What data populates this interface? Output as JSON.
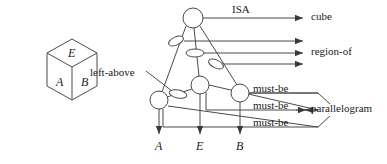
{
  "figure": {
    "type": "semantic-network-diagram",
    "cube": {
      "name": "cube-figure",
      "faces": [
        {
          "id": "top",
          "label": "E"
        },
        {
          "id": "left",
          "label": "A"
        },
        {
          "id": "right",
          "label": "B"
        }
      ]
    },
    "graph": {
      "nodes": [
        {
          "id": "n-top",
          "shape": "circle",
          "cx": 193,
          "cy": 18,
          "r": 10
        },
        {
          "id": "n-mid",
          "shape": "circle",
          "cx": 200,
          "cy": 85,
          "r": 9
        },
        {
          "id": "n-left",
          "shape": "circle",
          "cx": 159,
          "cy": 100,
          "r": 9
        },
        {
          "id": "n-right",
          "shape": "circle",
          "cx": 240,
          "cy": 93,
          "r": 9
        },
        {
          "id": "e-upper",
          "shape": "ellipse",
          "cx": 176,
          "cy": 41,
          "rx": 8,
          "ry": 4,
          "rot": -25
        },
        {
          "id": "e-center",
          "shape": "ellipse",
          "cx": 195,
          "cy": 53,
          "rx": 9,
          "ry": 4,
          "rot": 0
        },
        {
          "id": "e-right",
          "shape": "ellipse",
          "cx": 216,
          "cy": 64,
          "rx": 8,
          "ry": 4,
          "rot": 25
        },
        {
          "id": "e-left",
          "shape": "ellipse",
          "cx": 178,
          "cy": 94,
          "rx": 9,
          "ry": 4,
          "rot": 12
        }
      ],
      "edge_labels": [
        {
          "id": "isa",
          "text": "ISA",
          "x": 232,
          "y": 4
        },
        {
          "id": "left-above",
          "text": "left-above",
          "x": 90,
          "y": 67
        },
        {
          "id": "must-be-1",
          "text": "must-be",
          "x": 253,
          "y": 83
        },
        {
          "id": "must-be-2",
          "text": "must-be",
          "x": 253,
          "y": 100
        },
        {
          "id": "must-be-3",
          "text": "must-be",
          "x": 253,
          "y": 117
        }
      ],
      "target_labels": [
        {
          "id": "cube",
          "text": "cube",
          "x": 311,
          "y": 5
        },
        {
          "id": "region-of",
          "text": "region-of",
          "x": 311,
          "y": 40
        },
        {
          "id": "parallelogram",
          "text": "parallelogram",
          "x": 311,
          "y": 100
        }
      ],
      "terminal_labels": [
        {
          "id": "term-a",
          "text": "A",
          "x": 178,
          "y": 140
        },
        {
          "id": "term-e",
          "text": "E",
          "x": 217,
          "y": 140
        },
        {
          "id": "term-b",
          "text": "B",
          "x": 258,
          "y": 140
        }
      ]
    }
  }
}
